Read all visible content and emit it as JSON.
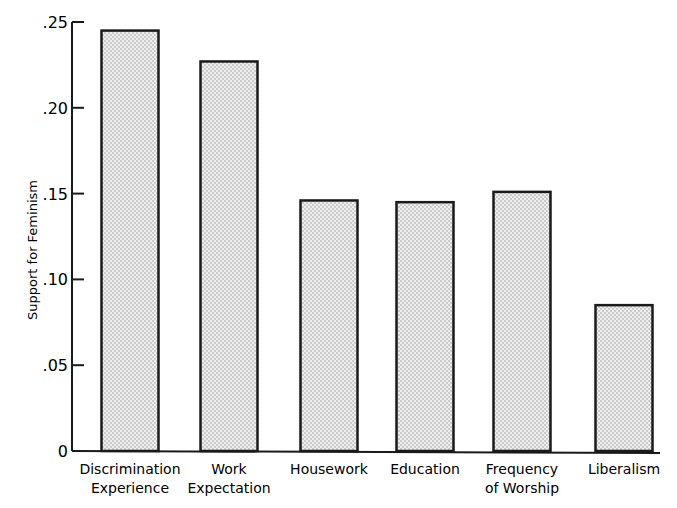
{
  "chart_data": {
    "type": "bar",
    "title": "",
    "xlabel": "",
    "ylabel": "Support for Feminism",
    "ylim": [
      0,
      0.25
    ],
    "yticks": [
      0,
      0.05,
      0.1,
      0.15,
      0.2,
      0.25
    ],
    "ytick_labels": [
      "0",
      ".05",
      ".10",
      ".15",
      ".20",
      ".25"
    ],
    "categories": [
      "Discrimination Experience",
      "Work Expectation",
      "Housework",
      "Education",
      "Frequency of Worship",
      "Liberalism"
    ],
    "category_lines": [
      [
        "Discrimination",
        "Experience"
      ],
      [
        "Work",
        "Expectation"
      ],
      [
        "Housework"
      ],
      [
        "Education"
      ],
      [
        "Frequency",
        "of Worship"
      ],
      [
        "Liberalism"
      ]
    ],
    "values": [
      0.245,
      0.227,
      0.146,
      0.145,
      0.151,
      0.085
    ],
    "grid": false,
    "legend": null,
    "bar_fill": "stippled gray",
    "colors": {
      "bar_edge": "#1a1a1a",
      "bar_fill": "#e6e6e6",
      "dot": "#8a8a8a"
    }
  }
}
